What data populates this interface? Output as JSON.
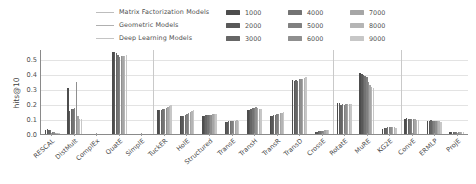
{
  "chart_data": {
    "type": "bar",
    "title": "",
    "xlabel": "",
    "ylabel": "hits@10",
    "ylim": [
      0.0,
      0.57
    ],
    "yticks": [
      "0.0",
      "0.1",
      "0.2",
      "0.3",
      "0.4",
      "0.5"
    ],
    "ytick_values": [
      0.0,
      0.1,
      0.2,
      0.3,
      0.4,
      0.5
    ],
    "grid": true,
    "legend_position": "top",
    "categories": [
      "RESCAL",
      "DistMult",
      "ComplEx",
      "QuatE",
      "SimplE",
      "TuckER",
      "HolE",
      "Structured",
      "TransE",
      "TransH",
      "TransR",
      "TransD",
      "CrossE",
      "RotatE",
      "MuRE",
      "KG2E",
      "ConvE",
      "ERMLP",
      "ProjE"
    ],
    "series": [
      {
        "name": "1000",
        "color": "#4d4d4d",
        "values": [
          0.028,
          0.31,
          0.0,
          0.553,
          0.0,
          0.16,
          0.12,
          0.12,
          0.082,
          0.158,
          0.122,
          0.36,
          0.016,
          0.21,
          0.408,
          0.036,
          0.104,
          0.09,
          0.014
        ]
      },
      {
        "name": "2000",
        "color": "#595959",
        "values": [
          0.032,
          0.152,
          0.0,
          0.548,
          0.0,
          0.158,
          0.118,
          0.122,
          0.08,
          0.162,
          0.124,
          0.358,
          0.016,
          0.206,
          0.404,
          0.04,
          0.106,
          0.088,
          0.015
        ]
      },
      {
        "name": "3000",
        "color": "#666666",
        "values": [
          0.03,
          0.168,
          0.0,
          0.54,
          0.0,
          0.162,
          0.124,
          0.125,
          0.084,
          0.166,
          0.126,
          0.362,
          0.018,
          0.196,
          0.396,
          0.042,
          0.1,
          0.092,
          0.014
        ]
      },
      {
        "name": "4000",
        "color": "#737373",
        "values": [
          0.024,
          0.166,
          0.0,
          0.53,
          0.0,
          0.166,
          0.13,
          0.128,
          0.086,
          0.172,
          0.128,
          0.356,
          0.018,
          0.198,
          0.388,
          0.044,
          0.102,
          0.09,
          0.016
        ]
      },
      {
        "name": "5000",
        "color": "#808080",
        "values": [
          0.014,
          0.174,
          0.0,
          0.516,
          0.0,
          0.17,
          0.136,
          0.128,
          0.088,
          0.176,
          0.132,
          0.368,
          0.02,
          0.196,
          0.38,
          0.044,
          0.104,
          0.086,
          0.014
        ]
      },
      {
        "name": "6000",
        "color": "#8f8f8f",
        "values": [
          0.012,
          0.35,
          0.0,
          0.522,
          0.0,
          0.176,
          0.14,
          0.13,
          0.086,
          0.184,
          0.136,
          0.372,
          0.022,
          0.2,
          0.348,
          0.046,
          0.1,
          0.088,
          0.016
        ]
      },
      {
        "name": "7000",
        "color": "#a6a6a6",
        "values": [
          0.01,
          0.122,
          0.0,
          0.526,
          0.0,
          0.182,
          0.146,
          0.132,
          0.09,
          0.176,
          0.14,
          0.366,
          0.024,
          0.198,
          0.33,
          0.044,
          0.098,
          0.084,
          0.014
        ]
      },
      {
        "name": "8000",
        "color": "#b5b5b5",
        "values": [
          0.008,
          0.104,
          0.0,
          0.524,
          0.0,
          0.186,
          0.152,
          0.134,
          0.092,
          0.17,
          0.142,
          0.376,
          0.026,
          0.2,
          0.312,
          0.046,
          0.096,
          0.086,
          0.012
        ]
      },
      {
        "name": "9000",
        "color": "#c7c7c7",
        "values": [
          0.006,
          0.102,
          0.0,
          0.528,
          0.0,
          0.196,
          0.158,
          0.136,
          0.09,
          0.168,
          0.146,
          0.38,
          0.028,
          0.202,
          0.31,
          0.042,
          0.094,
          0.082,
          0.012
        ]
      }
    ],
    "group_dividers_after": [
      "SimplE",
      "CrossE",
      "KG2E"
    ]
  },
  "legend": {
    "model_families": [
      {
        "label": "Matrix Factorization Models",
        "color": "#bdbdbd"
      },
      {
        "label": "Geometric Models",
        "color": "#b0b0b0"
      },
      {
        "label": "Deep Learning Models",
        "color": "#c4c4c4"
      }
    ],
    "dimensions": [
      {
        "label": "1000",
        "color": "#4d4d4d"
      },
      {
        "label": "2000",
        "color": "#595959"
      },
      {
        "label": "3000",
        "color": "#666666"
      },
      {
        "label": "4000",
        "color": "#737373"
      },
      {
        "label": "5000",
        "color": "#808080"
      },
      {
        "label": "6000",
        "color": "#8f8f8f"
      },
      {
        "label": "7000",
        "color": "#a6a6a6"
      },
      {
        "label": "8000",
        "color": "#b5b5b5"
      },
      {
        "label": "9000",
        "color": "#c7c7c7"
      }
    ]
  }
}
